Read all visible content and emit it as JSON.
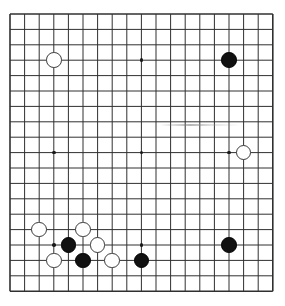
{
  "app": {
    "title": "Go Board Diagram",
    "board_type": "goban",
    "size": 19
  },
  "board": {
    "name": "go-board",
    "columns": 19,
    "rows": 19,
    "origin_x": 10,
    "origin_y": 14,
    "cell_w": 14.6,
    "cell_h": 15.4,
    "line_color": "#303030",
    "line_width": 1,
    "border_width": 1.6,
    "background_color": "#ffffff",
    "stone_radius": 7.8,
    "hoshi_radius": 1.8,
    "hoshi_color": "#1a1a1a",
    "hoshi_points": [
      {
        "col": 4,
        "row": 4
      },
      {
        "col": 10,
        "row": 4
      },
      {
        "col": 16,
        "row": 4
      },
      {
        "col": 4,
        "row": 10
      },
      {
        "col": 10,
        "row": 10
      },
      {
        "col": 16,
        "row": 10
      },
      {
        "col": 4,
        "row": 16
      },
      {
        "col": 10,
        "row": 16
      },
      {
        "col": 16,
        "row": 16
      }
    ],
    "stones": [
      {
        "color": "white",
        "col": 4,
        "row": 4,
        "label": "white-stone-d16"
      },
      {
        "color": "black",
        "col": 16,
        "row": 4,
        "label": "black-stone-q16"
      },
      {
        "color": "white",
        "col": 17,
        "row": 10,
        "label": "white-stone-r10"
      },
      {
        "color": "white",
        "col": 3,
        "row": 15,
        "label": "white-stone-c5"
      },
      {
        "color": "white",
        "col": 6,
        "row": 15,
        "label": "white-stone-f5"
      },
      {
        "color": "black",
        "col": 5,
        "row": 16,
        "label": "black-stone-e4"
      },
      {
        "color": "white",
        "col": 7,
        "row": 16,
        "label": "white-stone-g4"
      },
      {
        "color": "black",
        "col": 16,
        "row": 16,
        "label": "black-stone-q4"
      },
      {
        "color": "white",
        "col": 4,
        "row": 17,
        "label": "white-stone-d3"
      },
      {
        "color": "black",
        "col": 6,
        "row": 17,
        "label": "black-stone-f3"
      },
      {
        "color": "white",
        "col": 8,
        "row": 17,
        "label": "white-stone-h3"
      },
      {
        "color": "black",
        "col": 10,
        "row": 17,
        "label": "black-stone-k3"
      }
    ],
    "artifacts": [
      {
        "name": "scan-smudge",
        "x": 160,
        "y": 124,
        "width": 80,
        "height": 2
      }
    ],
    "counts": {
      "black_stones": 5,
      "white_stones": 7,
      "total_stones": 12
    }
  }
}
